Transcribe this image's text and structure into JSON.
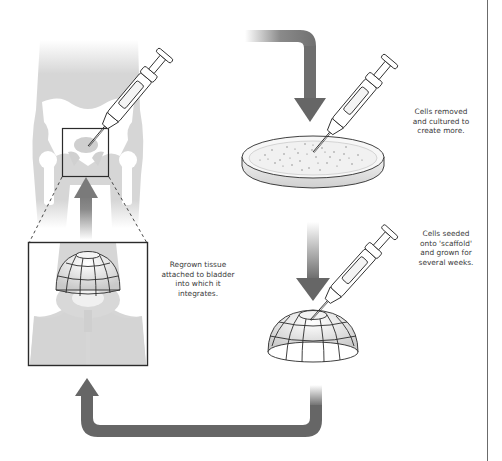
{
  "diagram": {
    "steps": [
      {
        "id": "culture",
        "caption_lines": [
          "Cells removed",
          "and cultured to",
          "create more."
        ]
      },
      {
        "id": "seed",
        "caption_lines": [
          "Cells seeded",
          "onto 'scaffold'",
          "and grown for",
          "several weeks."
        ]
      },
      {
        "id": "regrow",
        "caption_lines": [
          "Regrown tissue",
          "attached to bladder",
          "into which it",
          "integrates."
        ]
      }
    ],
    "icons": {
      "syringe": "syringe-icon",
      "petri_dish": "petri-dish-icon",
      "scaffold": "dome-scaffold-icon",
      "body": "pelvis-silhouette-icon",
      "arrow": "arrow-icon"
    },
    "colors": {
      "background": "#ffffff",
      "arrow": "#666666",
      "silhouette": "#d4d4d4",
      "bone": "#ffffff",
      "outline": "#2b2b2b",
      "text": "#3a3a3a",
      "rule": "#6b6b6b"
    }
  }
}
